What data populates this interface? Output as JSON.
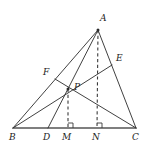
{
  "figure": {
    "width": 151,
    "height": 154,
    "background": "#ffffff",
    "stroke_color": "#2b2b2b",
    "baseline_color": "#555555",
    "dash_color": "#3a3a3a"
  },
  "points": {
    "A": {
      "label": "A",
      "x": 98,
      "y": 30,
      "label_x": 100,
      "label_y": 18
    },
    "B": {
      "label": "B",
      "x": 13,
      "y": 128,
      "label_x": 10,
      "label_y": 133
    },
    "C": {
      "label": "C",
      "x": 136,
      "y": 128,
      "label_x": 133,
      "label_y": 133
    },
    "D": {
      "label": "D",
      "x": 48,
      "y": 128,
      "label_x": 44,
      "label_y": 133
    },
    "M": {
      "label": "M",
      "x": 68,
      "y": 128,
      "label_x": 63,
      "label_y": 133
    },
    "N": {
      "label": "N",
      "x": 97,
      "y": 128,
      "label_x": 92,
      "label_y": 133
    },
    "E": {
      "label": "E",
      "x": 112,
      "y": 65,
      "label_x": 116,
      "label_y": 58
    },
    "F": {
      "label": "F",
      "x": 55,
      "y": 79,
      "label_x": 44,
      "label_y": 72
    },
    "P": {
      "label": "P",
      "x": 68,
      "y": 89,
      "label_x": 74,
      "label_y": 85
    }
  },
  "segments": [
    {
      "name": "side-AB",
      "from": "A",
      "to": "B",
      "style": "solid"
    },
    {
      "name": "side-AC",
      "from": "A",
      "to": "C",
      "style": "solid"
    },
    {
      "name": "base-BC",
      "from": "B",
      "to": "C",
      "style": "baseline"
    },
    {
      "name": "cevian-BE",
      "from": "B",
      "to": "E",
      "style": "solid"
    },
    {
      "name": "cevian-AD",
      "from": "A",
      "to": "D",
      "style": "solid"
    },
    {
      "name": "cevian-FC",
      "from": "F",
      "to": "C",
      "style": "solid"
    }
  ],
  "dashed_segments": [
    {
      "name": "altitude-AN",
      "from": "A",
      "to": "N"
    },
    {
      "name": "altitude-PM",
      "from": "P",
      "to": "M"
    }
  ],
  "right_angles": [
    {
      "name": "right-angle-at-M",
      "at": "M"
    },
    {
      "name": "right-angle-at-N",
      "at": "N"
    }
  ],
  "labels_order": [
    "A",
    "E",
    "F",
    "P",
    "B",
    "D",
    "M",
    "N",
    "C"
  ]
}
